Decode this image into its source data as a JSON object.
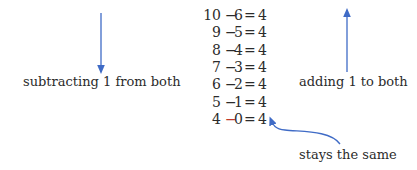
{
  "equations": [
    {
      "a": "10",
      "op": "−",
      "b": "6",
      "eq": "=",
      "result": "4",
      "op_color": "#2b2b2b"
    },
    {
      "a": "9",
      "op": "−",
      "b": "5",
      "eq": "=",
      "result": "4",
      "op_color": "#2b2b2b"
    },
    {
      "a": "8",
      "op": "−",
      "b": "4",
      "eq": "=",
      "result": "4",
      "op_color": "#2b2b2b"
    },
    {
      "a": "7",
      "op": "−",
      "b": "3",
      "eq": "=",
      "result": "4",
      "op_color": "#2b2b2b"
    },
    {
      "a": "6",
      "op": "−",
      "b": "2",
      "eq": "=",
      "result": "4",
      "op_color": "#2b2b2b"
    },
    {
      "a": "5",
      "op": "−",
      "b": "1",
      "eq": "=",
      "result": "4",
      "op_color": "#2b2b2b"
    },
    {
      "a": "4",
      "op": "−",
      "b": "0",
      "eq": "=",
      "result": "4",
      "op_color": "#c0392b"
    }
  ],
  "labels": {
    "left": "subtracting 1 from both",
    "right": "adding 1 to both",
    "bottom": "stays the same"
  },
  "colors": {
    "arrow": "#3f6bc6",
    "text": "#2b2b2b",
    "highlight": "#c0392b"
  }
}
